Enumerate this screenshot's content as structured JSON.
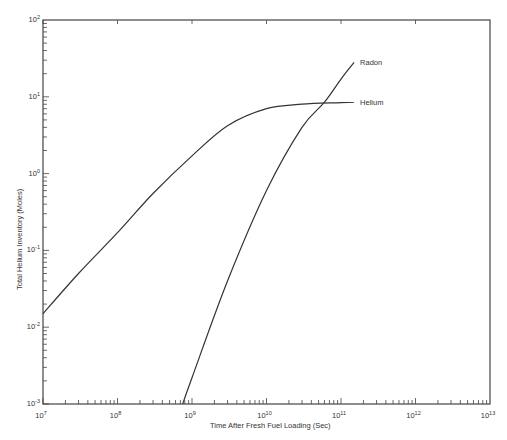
{
  "chart_data": {
    "type": "line",
    "title": "",
    "xlabel": "Time After Fresh Fuel Loading (Sec)",
    "ylabel": "Total Helium Inventory (Moles)",
    "xscale": "log",
    "yscale": "log",
    "xlim": [
      10000000.0,
      10000000000000.0
    ],
    "ylim": [
      0.001,
      100.0
    ],
    "x_tick_labels": [
      "10^7",
      "10^8",
      "10^9",
      "10^10",
      "10^11",
      "10^12",
      "10^13"
    ],
    "y_tick_labels": [
      "10^-3",
      "10^-2",
      "10^-1",
      "10^0",
      "10^1",
      "10^2"
    ],
    "grid": false,
    "legend": "inline labels at line ends",
    "series": [
      {
        "name": "Helium",
        "x": [
          10000000.0,
          30000000.0,
          100000000.0,
          300000000.0,
          1000000000.0,
          3000000000.0,
          10000000000.0,
          30000000000.0,
          100000000000.0,
          150000000000.0
        ],
        "y": [
          0.015,
          0.05,
          0.17,
          0.55,
          1.7,
          4.2,
          7.0,
          8.0,
          8.4,
          8.5
        ]
      },
      {
        "name": "Radon",
        "x": [
          750000000.0,
          1000000000.0,
          3000000000.0,
          10000000000.0,
          30000000000.0,
          60000000000.0,
          100000000000.0,
          150000000000.0
        ],
        "y": [
          0.001,
          0.0022,
          0.04,
          0.6,
          4.0,
          8.5,
          17,
          28
        ]
      }
    ]
  }
}
